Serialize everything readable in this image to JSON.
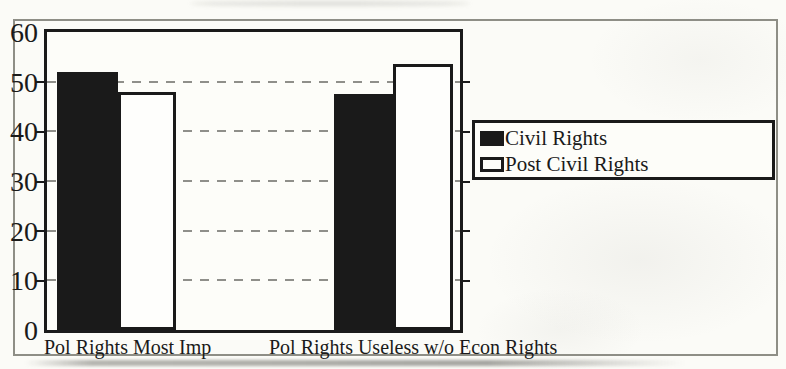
{
  "chart_data": {
    "type": "bar",
    "title": "",
    "xlabel": "",
    "ylabel": "",
    "categories": [
      "Pol Rights Most Imp",
      "Pol Rights Useless w/o Econ Rights"
    ],
    "series": [
      {
        "name": "Civil Rights",
        "swatch": "filled",
        "values": [
          52,
          47.5
        ]
      },
      {
        "name": "Post Civil Rights",
        "swatch": "outline",
        "values": [
          48,
          53.5
        ]
      }
    ],
    "ylim": [
      0,
      60
    ],
    "yticks": [
      0,
      10,
      20,
      30,
      40,
      50,
      60
    ],
    "gridlines": [
      10,
      20,
      30,
      40,
      50
    ],
    "grid_style": "dashed",
    "legend_position": "right-outside"
  },
  "colors": {
    "ink": "#1a1a1a",
    "paper": "#fbfbf7",
    "grid": "#8f8f8a",
    "frame_border": "#8e8e86",
    "bar_filled": "#1a1a1a",
    "bar_outline_fill": "#fefefc"
  }
}
